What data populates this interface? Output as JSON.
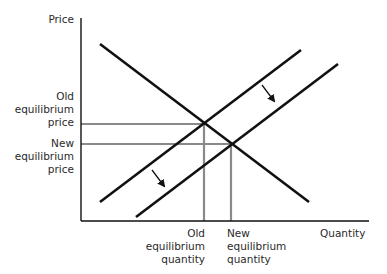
{
  "chart_data": {
    "type": "line",
    "title": "",
    "subtitle": "Supply increase (supply curve shifts right/down)",
    "xlabel": "Quantity",
    "ylabel": "Price",
    "grid": false,
    "legend": "none",
    "axis": {
      "origin": [
        81,
        221
      ],
      "y_top": [
        81,
        18
      ],
      "x_end": [
        369,
        221
      ],
      "color": "#111111"
    },
    "series": [
      {
        "name": "Demand",
        "color": "#111111",
        "points": [
          [
            100,
            44
          ],
          [
            309,
            202
          ]
        ]
      },
      {
        "name": "Old supply",
        "color": "#111111",
        "points": [
          [
            100,
            202
          ],
          [
            301,
            50
          ]
        ]
      },
      {
        "name": "New supply",
        "color": "#111111",
        "points": [
          [
            136,
            217
          ],
          [
            338,
            64
          ]
        ]
      }
    ],
    "equilibria": [
      {
        "name": "Old equilibrium",
        "point": [
          204,
          124
        ],
        "guide_color": "#8a8a8a"
      },
      {
        "name": "New equilibrium",
        "point": [
          231,
          144
        ],
        "guide_color": "#8a8a8a"
      }
    ],
    "arrows": [
      {
        "from": [
          262,
          85
        ],
        "to": [
          274,
          101
        ]
      },
      {
        "from": [
          152,
          170
        ],
        "to": [
          164,
          186
        ]
      }
    ],
    "annotations": {
      "old_price": "Old\nequilibrium\nprice",
      "new_price": "New\nequilibrium\nprice",
      "old_quantity": "Old\nequilibrium\nquantity",
      "new_quantity": "New\nequilibrium\nquantity"
    }
  },
  "labels": {
    "y_axis": "Price",
    "x_axis": "Quantity",
    "old_price": "Old\nequilibrium\nprice",
    "new_price": "New\nequilibrium\nprice",
    "old_quantity": "Old\nequilibrium\nquantity",
    "new_quantity": "New\nequilibrium\nquantity"
  }
}
